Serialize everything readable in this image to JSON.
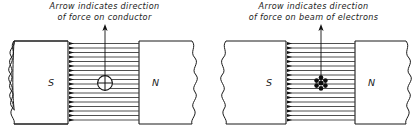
{
  "figure": {
    "background_color": "#ffffff",
    "line_color": "#1a1a1a",
    "field_line_color": "#3c3c3c"
  },
  "panels": [
    {
      "id": "conductor",
      "caption_line1": "Arrow indicates direction",
      "caption_line2": "of force on conductor",
      "south_pole_label": "S",
      "north_pole_label": "N",
      "field_line_count": 18,
      "field_direction": "left-to-right (arrowheads at S pole face)",
      "force_arrow_direction": "up",
      "center_symbol": "circled-cross",
      "center_symbol_meaning": "current-carrying conductor, current into page"
    },
    {
      "id": "electron-beam",
      "caption_line1": "Arrow indicates direction",
      "caption_line2": "of force on beam of electrons",
      "south_pole_label": "S",
      "north_pole_label": "N",
      "field_line_count": 18,
      "field_direction": "left-to-right (arrowheads at S pole face)",
      "force_arrow_direction": "up",
      "center_symbol": "electron-cluster",
      "center_symbol_meaning": "beam of electrons travelling into page"
    }
  ]
}
